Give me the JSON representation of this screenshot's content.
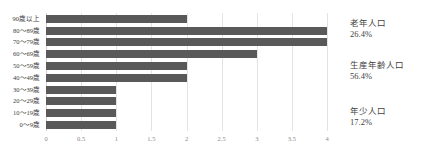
{
  "chart_data": {
    "type": "bar",
    "orientation": "horizontal",
    "title": "",
    "xlabel": "",
    "ylabel": "",
    "categories": [
      "90歳以上",
      "80～89歳",
      "70～79歳",
      "60～69歳",
      "50～59歳",
      "40～49歳",
      "30～39歳",
      "20～29歳",
      "10～19歳",
      "0～9歳"
    ],
    "values": [
      2,
      4,
      4,
      3,
      2,
      2,
      1,
      1,
      1,
      1
    ],
    "xlim": [
      0,
      4
    ],
    "xticks": [
      0,
      0.5,
      1,
      1.5,
      2,
      2.5,
      3,
      3.5,
      4
    ],
    "xtick_labels": [
      "0",
      "0.5",
      "1",
      "1.5",
      "2",
      "2.5",
      "3",
      "3.5",
      "4"
    ],
    "grid": true,
    "grid_axis": "x",
    "legend": "none",
    "bar_color": "#595959",
    "grid_color": "#e3e3e3",
    "annotations": [
      {
        "id": "elderly",
        "label": "老年人口",
        "value": "26.4%"
      },
      {
        "id": "working",
        "label": "生産年齢人口",
        "value": "56.4%"
      },
      {
        "id": "youth",
        "label": "年少人口",
        "value": "17.2%"
      }
    ]
  }
}
